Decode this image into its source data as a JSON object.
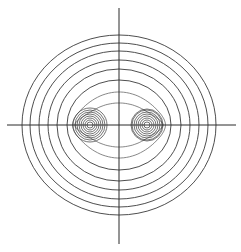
{
  "diagram": {
    "width": 241,
    "height": 252,
    "colors": {
      "background": "#ffffff",
      "line": "#3a3a3a",
      "axis": "#2a2a2a"
    },
    "axes": {
      "horizontal": {
        "x1": 7,
        "x2": 236,
        "y": 125
      },
      "vertical": {
        "x": 119,
        "y1": 8,
        "y2": 244
      }
    },
    "foci": [
      {
        "cx": 90,
        "cy": 125,
        "radii": [
          3,
          5,
          7,
          9,
          11,
          13,
          15,
          17
        ]
      },
      {
        "cx": 147,
        "cy": 125,
        "radii": [
          3,
          5,
          7,
          9,
          11,
          13,
          15,
          16
        ]
      }
    ],
    "outer_ellipses": [
      {
        "rx": 97,
        "ry": 90
      },
      {
        "rx": 89,
        "ry": 82
      },
      {
        "rx": 80,
        "ry": 74
      },
      {
        "rx": 71,
        "ry": 65
      },
      {
        "rx": 62,
        "ry": 56
      },
      {
        "rx": 52,
        "ry": 45
      }
    ],
    "wavy_contours": [
      {
        "rx": 43,
        "ry": 33
      },
      {
        "rx": 36,
        "ry": 22
      }
    ]
  }
}
